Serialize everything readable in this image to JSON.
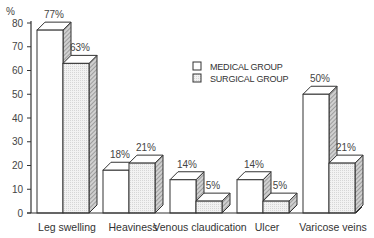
{
  "chart_data": {
    "type": "bar",
    "title": "",
    "xlabel": "",
    "ylabel": "%",
    "ylim": [
      0,
      80
    ],
    "yticks": [
      0,
      10,
      20,
      30,
      40,
      50,
      60,
      70,
      80
    ],
    "grid": false,
    "style": "3d-bars",
    "legend_position": "upper-right-inside",
    "categories": [
      "Leg swelling",
      "Heaviness",
      "Venous claudication",
      "Ulcer",
      "Varicose veins"
    ],
    "series": [
      {
        "name": "MEDICAL GROUP",
        "values": [
          77,
          18,
          14,
          14,
          50
        ],
        "labels": [
          "77%",
          "18%",
          "14%",
          "14%",
          "50%"
        ],
        "fill": "#ffffff"
      },
      {
        "name": "SURGICAL GROUP",
        "values": [
          63,
          21,
          5,
          5,
          21
        ],
        "labels": [
          "63%",
          "21%",
          "5%",
          "5%",
          "21%"
        ],
        "fill": "#ececec"
      }
    ]
  },
  "axis": {
    "unit_label": "%"
  },
  "colors": {
    "line": "#333333",
    "front_medical": "#ffffff",
    "front_surgical": "#ececec",
    "side": "#a8a8a8",
    "top": "#ffffff"
  }
}
